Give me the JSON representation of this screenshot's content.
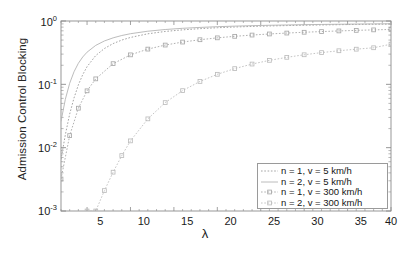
{
  "chart_data": {
    "type": "line",
    "title": "",
    "xlabel": "λ",
    "ylabel": "Admission Control Blocking",
    "yscale": "log",
    "xscale": "linear",
    "xlim": [
      2,
      40
    ],
    "ylim": [
      0.001,
      1
    ],
    "xticks": [
      5,
      10,
      15,
      20,
      25,
      30,
      35,
      40
    ],
    "xticklabels": [
      "5",
      "10",
      "15",
      "20",
      "25",
      "30",
      "35",
      "40"
    ],
    "yticks": [
      0.001,
      0.01,
      0.1,
      1
    ],
    "yticklabels": [
      "10⁻³",
      "10⁻²",
      "10⁻¹",
      "10⁰"
    ],
    "grid": false,
    "legend_position": "lower right",
    "series": [
      {
        "name": "n = 1, v = 5 km/h",
        "marker": "none",
        "linestyle": "dotted",
        "color": "#9a9a9a",
        "x": [
          2,
          2.5,
          3,
          3.5,
          4,
          4.5,
          5,
          6,
          7,
          8,
          9,
          10,
          12,
          14,
          16,
          18,
          20,
          22,
          24,
          26,
          28,
          30,
          32,
          34,
          36,
          38,
          40
        ],
        "y": [
          0.0065,
          0.016,
          0.034,
          0.061,
          0.098,
          0.142,
          0.19,
          0.285,
          0.368,
          0.44,
          0.5,
          0.55,
          0.628,
          0.684,
          0.725,
          0.757,
          0.783,
          0.804,
          0.821,
          0.835,
          0.847,
          0.858,
          0.867,
          0.875,
          0.882,
          0.888,
          0.893
        ]
      },
      {
        "name": "n = 2, v = 5 km/h",
        "marker": "none",
        "linestyle": "solid",
        "color": "#b4b4b4",
        "x": [
          2,
          2.5,
          3,
          3.5,
          4,
          4.5,
          5,
          6,
          7,
          8,
          9,
          10,
          12,
          14,
          16,
          18,
          20,
          22,
          24,
          26,
          28,
          30,
          32,
          34,
          36,
          38,
          40
        ],
        "y": [
          0.026,
          0.058,
          0.104,
          0.158,
          0.215,
          0.27,
          0.322,
          0.412,
          0.484,
          0.542,
          0.59,
          0.63,
          0.69,
          0.734,
          0.767,
          0.792,
          0.813,
          0.83,
          0.844,
          0.856,
          0.866,
          0.875,
          0.882,
          0.889,
          0.895,
          0.9,
          0.905
        ]
      },
      {
        "name": "n = 1, v = 300 km/h",
        "marker": "square",
        "linestyle": "dotted",
        "color": "#a8a8a8",
        "x": [
          2,
          3,
          4,
          5,
          6,
          8,
          10,
          12,
          14,
          16,
          18,
          20,
          22,
          24,
          26,
          28,
          30,
          32,
          34,
          36,
          38,
          40
        ],
        "y": [
          0.0032,
          0.0155,
          0.042,
          0.079,
          0.122,
          0.212,
          0.292,
          0.36,
          0.417,
          0.465,
          0.506,
          0.542,
          0.573,
          0.6,
          0.624,
          0.645,
          0.664,
          0.681,
          0.697,
          0.711,
          0.724,
          0.736
        ]
      },
      {
        "name": "n = 2, v = 300 km/h",
        "marker": "square",
        "linestyle": "dotted",
        "color": "#bdbdbd",
        "x": [
          5,
          6,
          7,
          8,
          9,
          10,
          12,
          14,
          16,
          18,
          20,
          22,
          24,
          26,
          28,
          30,
          32,
          34,
          36,
          38,
          40
        ],
        "y": [
          0.00042,
          0.00098,
          0.0021,
          0.0041,
          0.0075,
          0.0128,
          0.0285,
          0.0515,
          0.0795,
          0.111,
          0.144,
          0.177,
          0.209,
          0.239,
          0.267,
          0.293,
          0.317,
          0.339,
          0.359,
          0.378,
          0.43
        ]
      }
    ]
  },
  "legend": {
    "entries": [
      "n = 1, v = 5 km/h",
      "n = 2, v = 5 km/h",
      "n = 1, v = 300 km/h",
      "n = 2, v = 300 km/h"
    ]
  },
  "axes": {
    "y_tick_labels": [
      "10",
      "10",
      "10",
      "10"
    ],
    "y_tick_exponents": [
      "0",
      "-1",
      "-2",
      "-3"
    ],
    "x_tick_labels": [
      "5",
      "10",
      "15",
      "20",
      "25",
      "30",
      "35",
      "40"
    ],
    "x_axis_title": "λ",
    "y_axis_title": "Admission Control Blocking"
  },
  "colors": {
    "frame": "#8c8c8c",
    "background": "#ffffff",
    "text": "#1a1a1a"
  }
}
